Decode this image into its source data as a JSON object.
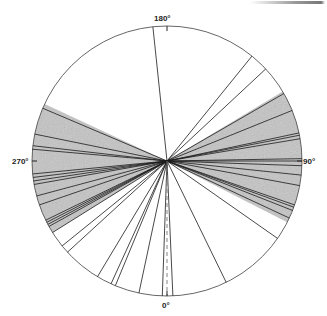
{
  "diagram": {
    "type": "polar-direction-plot",
    "center": [
      167,
      161
    ],
    "radius": 135,
    "angle_convention": "0° at bottom, 90° at right, 180° at top, 270° at left",
    "labels": [
      {
        "text": "180°",
        "angle": 180
      },
      {
        "text": "90°",
        "angle": 90
      },
      {
        "text": "0°",
        "angle": 0
      },
      {
        "text": "270°",
        "angle": 270
      }
    ],
    "shaded_sectors": [
      {
        "from": 63,
        "to": 121,
        "color": "#c4c4c4"
      },
      {
        "from": 245,
        "to": 302,
        "color": "#c4c4c4"
      }
    ],
    "reference_line": {
      "angle": 0,
      "style": "dashed"
    },
    "directions": [
      186,
      141,
      133,
      120,
      112,
      102,
      101,
      99.5,
      91,
      90,
      88,
      84,
      79.5,
      71,
      70,
      68.5,
      65,
      55,
      26,
      2.5,
      358,
      348,
      337.5,
      335.5,
      329,
      312.5,
      309,
      302,
      299,
      298,
      297,
      296,
      289,
      285,
      280,
      278.5,
      277,
      275.5,
      265,
      263.5,
      258.5,
      247
    ],
    "line_color": "#1a1a1a",
    "circle_color": "#555555"
  },
  "chart_data": {
    "type": "polar-lines",
    "title": "",
    "axis_labels": [
      "0°",
      "90°",
      "180°",
      "270°"
    ],
    "directions_deg": [
      186,
      141,
      133,
      120,
      112,
      102,
      101,
      99.5,
      91,
      90,
      88,
      84,
      79.5,
      71,
      70,
      68.5,
      65,
      55,
      26,
      2.5,
      358,
      348,
      337.5,
      335.5,
      329,
      312.5,
      309,
      302,
      299,
      298,
      297,
      296,
      289,
      285,
      280,
      278.5,
      277,
      275.5,
      265,
      263.5,
      258.5,
      247
    ],
    "shaded_ranges_deg": [
      [
        63,
        121
      ],
      [
        245,
        302
      ]
    ]
  }
}
